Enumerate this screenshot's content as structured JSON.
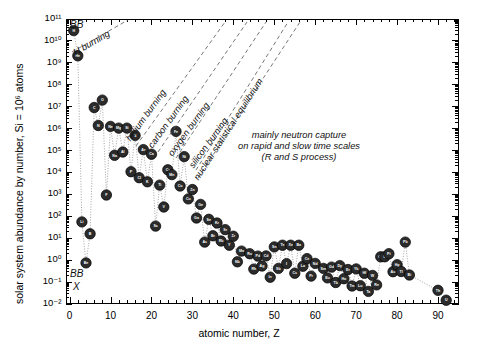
{
  "chart_data": {
    "type": "scatter",
    "title": "",
    "xlabel": "atomic number, Z",
    "ylabel": "solar system abundance by number, Si = 10⁶ atoms",
    "xlim": [
      -1,
      95
    ],
    "ylim": [
      -2,
      11
    ],
    "xticks": [
      0,
      10,
      20,
      30,
      40,
      50,
      60,
      70,
      80,
      90
    ],
    "xtick_labels": [
      "0",
      "10",
      "20",
      "30",
      "40",
      "50",
      "60",
      "70",
      "80",
      "90"
    ],
    "ytick_exponents": [
      11,
      10,
      9,
      8,
      7,
      6,
      5,
      4,
      3,
      2,
      1,
      0,
      -1,
      -2
    ],
    "ytick_labels": [
      "10¹¹",
      "10¹⁰",
      "10⁹",
      "10⁸",
      "10⁷",
      "10⁶",
      "10⁵",
      "10⁴",
      "10³",
      "10²",
      "10¹",
      "10⁰",
      "10⁻¹",
      "10⁻²"
    ],
    "grid": false,
    "legend": "none",
    "log_y": true,
    "marker": {
      "shape": "circle",
      "fill": "#2b2b2b",
      "edge": "#000000",
      "radius_px": 5.2,
      "label_color": "#ffffff"
    },
    "connector": {
      "style": "dotted",
      "color": "#9a9a9a"
    },
    "points": [
      {
        "Z": 1,
        "el": "H",
        "log_abundance": 10.45
      },
      {
        "Z": 2,
        "el": "He",
        "log_abundance": 9.3
      },
      {
        "Z": 3,
        "el": "Li",
        "log_abundance": 1.72
      },
      {
        "Z": 4,
        "el": "Be",
        "log_abundance": -0.15
      },
      {
        "Z": 5,
        "el": "B",
        "log_abundance": 1.18
      },
      {
        "Z": 6,
        "el": "C",
        "log_abundance": 6.94
      },
      {
        "Z": 7,
        "el": "N",
        "log_abundance": 6.12
      },
      {
        "Z": 8,
        "el": "O",
        "log_abundance": 7.28
      },
      {
        "Z": 9,
        "el": "F",
        "log_abundance": 2.95
      },
      {
        "Z": 10,
        "el": "Ne",
        "log_abundance": 6.08
      },
      {
        "Z": 11,
        "el": "Na",
        "log_abundance": 4.76
      },
      {
        "Z": 12,
        "el": "Mg",
        "log_abundance": 6.0
      },
      {
        "Z": 13,
        "el": "Al",
        "log_abundance": 4.91
      },
      {
        "Z": 14,
        "el": "Si",
        "log_abundance": 6.0
      },
      {
        "Z": 15,
        "el": "P",
        "log_abundance": 4.01
      },
      {
        "Z": 16,
        "el": "S",
        "log_abundance": 5.67
      },
      {
        "Z": 17,
        "el": "Cl",
        "log_abundance": 3.74
      },
      {
        "Z": 18,
        "el": "Ar",
        "log_abundance": 5.02
      },
      {
        "Z": 19,
        "el": "K",
        "log_abundance": 3.55
      },
      {
        "Z": 20,
        "el": "Ca",
        "log_abundance": 4.81
      },
      {
        "Z": 21,
        "el": "Sc",
        "log_abundance": 1.53
      },
      {
        "Z": 22,
        "el": "Ti",
        "log_abundance": 3.4
      },
      {
        "Z": 23,
        "el": "V",
        "log_abundance": 2.4
      },
      {
        "Z": 24,
        "el": "Cr",
        "log_abundance": 4.1
      },
      {
        "Z": 25,
        "el": "Mn",
        "log_abundance": 3.88
      },
      {
        "Z": 26,
        "el": "Fe",
        "log_abundance": 5.85
      },
      {
        "Z": 27,
        "el": "Co",
        "log_abundance": 3.36
      },
      {
        "Z": 28,
        "el": "Ni",
        "log_abundance": 4.7
      },
      {
        "Z": 29,
        "el": "Cu",
        "log_abundance": 2.77
      },
      {
        "Z": 30,
        "el": "Zn",
        "log_abundance": 3.2
      },
      {
        "Z": 31,
        "el": "Ga",
        "log_abundance": 1.9
      },
      {
        "Z": 32,
        "el": "Ge",
        "log_abundance": 2.52
      },
      {
        "Z": 33,
        "el": "As",
        "log_abundance": 0.8
      },
      {
        "Z": 34,
        "el": "Se",
        "log_abundance": 1.84
      },
      {
        "Z": 35,
        "el": "Br",
        "log_abundance": 1.09
      },
      {
        "Z": 36,
        "el": "Kr",
        "log_abundance": 1.67
      },
      {
        "Z": 37,
        "el": "Rb",
        "log_abundance": 0.85
      },
      {
        "Z": 38,
        "el": "Sr",
        "log_abundance": 1.37
      },
      {
        "Z": 39,
        "el": "Y",
        "log_abundance": 0.66
      },
      {
        "Z": 40,
        "el": "Zr",
        "log_abundance": 1.07
      },
      {
        "Z": 41,
        "el": "Nb",
        "log_abundance": -0.1
      },
      {
        "Z": 42,
        "el": "Mo",
        "log_abundance": 0.39
      },
      {
        "Z": 44,
        "el": "Ru",
        "log_abundance": 0.27
      },
      {
        "Z": 45,
        "el": "Rh",
        "log_abundance": -0.43
      },
      {
        "Z": 46,
        "el": "Pd",
        "log_abundance": 0.16
      },
      {
        "Z": 47,
        "el": "Ag",
        "log_abundance": -0.29
      },
      {
        "Z": 48,
        "el": "Cd",
        "log_abundance": 0.17
      },
      {
        "Z": 49,
        "el": "In",
        "log_abundance": -0.8
      },
      {
        "Z": 50,
        "el": "Sn",
        "log_abundance": 0.58
      },
      {
        "Z": 51,
        "el": "Sb",
        "log_abundance": -0.4
      },
      {
        "Z": 52,
        "el": "Te",
        "log_abundance": 0.66
      },
      {
        "Z": 53,
        "el": "I",
        "log_abundance": -0.18
      },
      {
        "Z": 54,
        "el": "Xe",
        "log_abundance": 0.66
      },
      {
        "Z": 55,
        "el": "Cs",
        "log_abundance": -0.62
      },
      {
        "Z": 56,
        "el": "Ba",
        "log_abundance": 0.66
      },
      {
        "Z": 57,
        "el": "La",
        "log_abundance": -0.3
      },
      {
        "Z": 58,
        "el": "Ce",
        "log_abundance": 0.05
      },
      {
        "Z": 59,
        "el": "Pr",
        "log_abundance": -0.75
      },
      {
        "Z": 60,
        "el": "Nd",
        "log_abundance": -0.17
      },
      {
        "Z": 62,
        "el": "Sm",
        "log_abundance": -0.4
      },
      {
        "Z": 63,
        "el": "Eu",
        "log_abundance": -0.83
      },
      {
        "Z": 64,
        "el": "Gd",
        "log_abundance": -0.34
      },
      {
        "Z": 65,
        "el": "Tb",
        "log_abundance": -1.04
      },
      {
        "Z": 66,
        "el": "Dy",
        "log_abundance": -0.27
      },
      {
        "Z": 67,
        "el": "Ho",
        "log_abundance": -0.87
      },
      {
        "Z": 68,
        "el": "Er",
        "log_abundance": -0.45
      },
      {
        "Z": 69,
        "el": "Tm",
        "log_abundance": -1.2
      },
      {
        "Z": 70,
        "el": "Yb",
        "log_abundance": -0.42
      },
      {
        "Z": 71,
        "el": "Lu",
        "log_abundance": -1.19
      },
      {
        "Z": 72,
        "el": "Hf",
        "log_abundance": -0.62
      },
      {
        "Z": 73,
        "el": "Ta",
        "log_abundance": -1.45
      },
      {
        "Z": 74,
        "el": "W",
        "log_abundance": -0.72
      },
      {
        "Z": 75,
        "el": "Re",
        "log_abundance": -1.15
      },
      {
        "Z": 76,
        "el": "Os",
        "log_abundance": 0.13
      },
      {
        "Z": 77,
        "el": "Ir",
        "log_abundance": 0.13
      },
      {
        "Z": 78,
        "el": "Pt",
        "log_abundance": 0.27
      },
      {
        "Z": 79,
        "el": "Au",
        "log_abundance": -0.55
      },
      {
        "Z": 80,
        "el": "Hg",
        "log_abundance": -0.23
      },
      {
        "Z": 81,
        "el": "Tl",
        "log_abundance": -0.54
      },
      {
        "Z": 82,
        "el": "Pb",
        "log_abundance": 0.8
      },
      {
        "Z": 83,
        "el": "Bi",
        "log_abundance": -0.7
      },
      {
        "Z": 90,
        "el": "Th",
        "log_abundance": -1.4
      },
      {
        "Z": 92,
        "el": "U",
        "log_abundance": -1.85
      }
    ],
    "annotations": {
      "process_lines": [
        {
          "id": "h-burning",
          "label": "H burning"
        },
        {
          "id": "helium-burning",
          "label": "helium burning"
        },
        {
          "id": "carbon-burning",
          "label": "carbon burning"
        },
        {
          "id": "oxygen-burning",
          "label": "oxygen burning"
        },
        {
          "id": "silicon-burning",
          "label": "silicon burning"
        },
        {
          "id": "nse",
          "label": "nuclear statistical equilibrium"
        }
      ],
      "neutron_capture": {
        "line1": "mainly neutron capture",
        "line2": "on rapid and slow time scales",
        "line3": "(R and S process)"
      },
      "corner_top_left": "BB",
      "corner_bottom_left_1": "BB",
      "corner_bottom_left_2": "X"
    }
  }
}
